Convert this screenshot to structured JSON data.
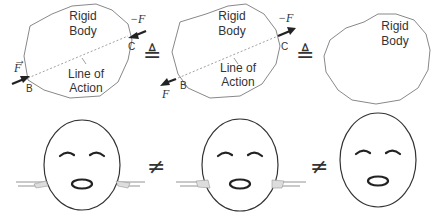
{
  "top_row": {
    "panels": [
      {
        "body_label_line1": "Rigid",
        "body_label_line2": "Body",
        "force_label": "F",
        "neg_force_label": "−F",
        "point_b": "B",
        "point_c": "C",
        "line_label_line1": "Line of",
        "line_label_line2": "Action",
        "force_direction": "push-inward"
      },
      {
        "body_label_line1": "Rigid",
        "body_label_line2": "Body",
        "force_label": "F",
        "neg_force_label": "−F",
        "point_b": "B",
        "point_c": "C",
        "line_label_line1": "Line of",
        "line_label_line2": "Action",
        "force_direction": "pull-outward"
      },
      {
        "body_label_line1": "Rigid",
        "body_label_line2": "Body"
      }
    ],
    "equivalence_symbols": [
      "≜",
      "≜"
    ]
  },
  "bottom_row": {
    "faces": [
      {
        "state": "hands-pushing-inward"
      },
      {
        "state": "hands-pulling-outward"
      },
      {
        "state": "no-hands"
      }
    ],
    "inequality_symbols": [
      "≠",
      "≠"
    ]
  }
}
